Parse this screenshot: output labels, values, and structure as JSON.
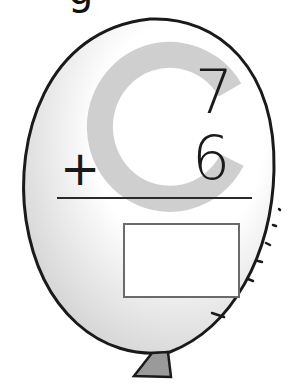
{
  "worksheet": {
    "letter_watermark": "C",
    "top_partial_glyph": "g",
    "problem": {
      "addend1": "7",
      "operator": "+",
      "addend2": "6",
      "answer": ""
    }
  },
  "colors": {
    "outline": "#1a1a1a",
    "watermark": "#cfcfcf",
    "balloon_shade": "#e6e6e6",
    "knot": "#9a9a9a",
    "box_border": "#6a6a6a"
  }
}
